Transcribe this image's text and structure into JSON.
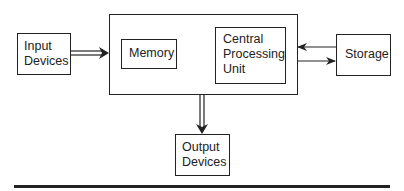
{
  "diagram": {
    "nodes": {
      "input": {
        "line1": "Input",
        "line2": "Devices"
      },
      "memory": {
        "label": "Memory"
      },
      "cpu": {
        "line1": "Central",
        "line2": "Processing",
        "line3": "Unit"
      },
      "storage": {
        "label": "Storage"
      },
      "output": {
        "line1": "Output",
        "line2": "Devices"
      }
    },
    "edges": [
      {
        "from": "Input Devices",
        "to": "Computer",
        "style": "double"
      },
      {
        "from": "Memory",
        "to": "Central Processing Unit",
        "style": "single"
      },
      {
        "from": "Central Processing Unit",
        "to": "Memory",
        "style": "single"
      },
      {
        "from": "Storage",
        "to": "Computer",
        "style": "single"
      },
      {
        "from": "Computer",
        "to": "Storage",
        "style": "single"
      },
      {
        "from": "Computer",
        "to": "Output Devices",
        "style": "double"
      }
    ],
    "colors": {
      "stroke": "#222222",
      "background": "#ffffff"
    }
  }
}
